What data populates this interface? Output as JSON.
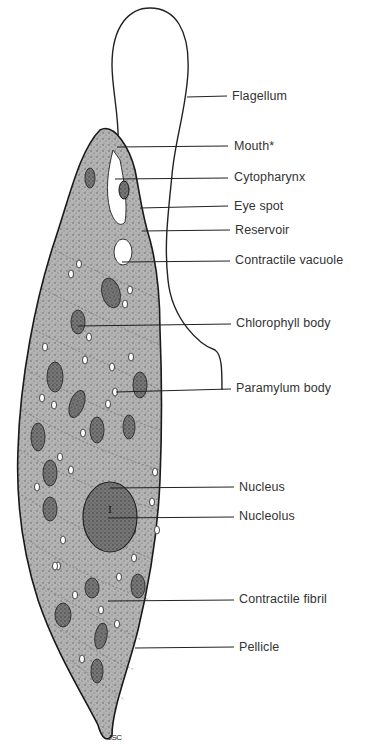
{
  "figure": {
    "signature": "JSC",
    "colors": {
      "outline": "#222222",
      "body_fill": "#a8a8a8",
      "organelle_fill": "#6e6e6e",
      "text": "#333333",
      "background": "#ffffff"
    }
  },
  "labels": [
    {
      "id": "flagellum",
      "text": "Flagellum",
      "x": 232,
      "y": 88
    },
    {
      "id": "mouth",
      "text": "Mouth*",
      "x": 234,
      "y": 140
    },
    {
      "id": "cytopharynx",
      "text": "Cytopharynx",
      "x": 234,
      "y": 169
    },
    {
      "id": "eye-spot",
      "text": "Eye spot",
      "x": 234,
      "y": 198
    },
    {
      "id": "reservoir",
      "text": "Reservoir",
      "x": 235,
      "y": 222
    },
    {
      "id": "contractile-vacuole",
      "text": "Contractile vacuole",
      "x": 235,
      "y": 252
    },
    {
      "id": "chlorophyll-body",
      "text": "Chlorophyll body",
      "x": 236,
      "y": 315
    },
    {
      "id": "paramylum-body",
      "text": "Paramylum body",
      "x": 236,
      "y": 380
    },
    {
      "id": "nucleus",
      "text": "Nucleus",
      "x": 239,
      "y": 479
    },
    {
      "id": "nucleolus",
      "text": "Nucleolus",
      "x": 239,
      "y": 508
    },
    {
      "id": "contractile-fibril",
      "text": "Contractile fibril",
      "x": 239,
      "y": 591
    },
    {
      "id": "pellicle",
      "text": "Pellicle",
      "x": 239,
      "y": 639
    }
  ]
}
